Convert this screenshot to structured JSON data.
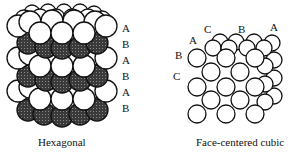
{
  "figure": {
    "left": {
      "caption": "Hexagonal",
      "layer_labels": [
        "A",
        "B",
        "A",
        "B",
        "A",
        "B"
      ]
    },
    "right": {
      "caption": "Face-centered cubic",
      "layer_labels": {
        "top": [
          "C",
          "B",
          "A"
        ],
        "left": [
          "A",
          "B",
          "C"
        ]
      }
    }
  },
  "colors": {
    "sphere_light": "#ffffff",
    "sphere_dark": "#3a3a3a",
    "outline": "#111111"
  }
}
